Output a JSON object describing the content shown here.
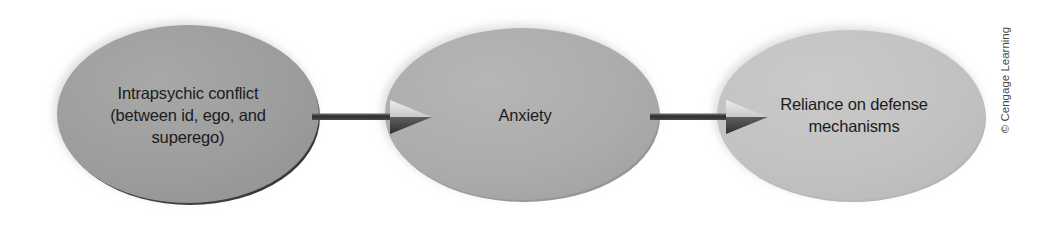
{
  "figure": {
    "type": "flow-diagram",
    "background_color": "#ffffff",
    "credit": "© Cengage Learning"
  },
  "nodes": [
    {
      "id": "intrapsychic-conflict",
      "label": "Intrapsychic conflict\n(between id, ego, and\nsuperego)",
      "shape": "ellipse",
      "fill_color": "#9e9e9e",
      "rim_color": "#1e1e1e",
      "text_color": "#1b1b1b",
      "cx": 188,
      "cy": 114,
      "rx": 131,
      "ry": 89
    },
    {
      "id": "anxiety",
      "label": "Anxiety",
      "shape": "ellipse",
      "fill_color": "#adadad",
      "rim_color": "#8a8a8a",
      "text_color": "#1b1b1b",
      "cx": 522,
      "cy": 114,
      "rx": 137,
      "ry": 86
    },
    {
      "id": "defense-mechanisms",
      "label": "Reliance on defense\nmechanisms",
      "shape": "ellipse",
      "fill_color": "#c3c3c3",
      "rim_color": "#b0b0b0",
      "text_color": "#1b1b1b",
      "cx": 851,
      "cy": 115,
      "rx": 134,
      "ry": 85
    }
  ],
  "arrows": [
    {
      "id": "arrow-conflict-to-anxiety",
      "from": "intrapsychic-conflict",
      "to": "anxiety",
      "color": "#3a3a3a",
      "x1": 312,
      "x2": 424,
      "y": 117
    },
    {
      "id": "arrow-anxiety-to-defense",
      "from": "anxiety",
      "to": "defense-mechanisms",
      "color": "#3a3a3a",
      "x1": 652,
      "x2": 760,
      "y": 117
    }
  ]
}
